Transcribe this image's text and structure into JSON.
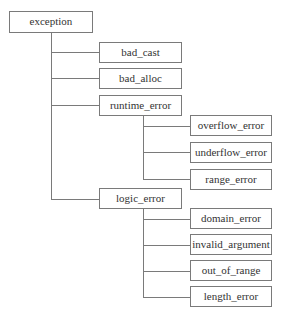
{
  "diagram": {
    "type": "tree",
    "title": "",
    "root": {
      "label": "exception"
    },
    "children": [
      {
        "label": "bad_cast"
      },
      {
        "label": "bad_alloc"
      },
      {
        "label": "runtime_error"
      },
      {
        "label": "logic_error"
      }
    ],
    "runtime_error_children": [
      {
        "label": "overflow_error"
      },
      {
        "label": "underflow_error"
      },
      {
        "label": "range_error"
      }
    ],
    "logic_error_children": [
      {
        "label": "domain_error"
      },
      {
        "label": "invalid_argument"
      },
      {
        "label": "out_of_range"
      },
      {
        "label": "length_error"
      }
    ],
    "colors": {
      "line": "#7a7a7a",
      "box_border": "#7a7a7a",
      "text": "#333333",
      "background": "#ffffff"
    }
  }
}
